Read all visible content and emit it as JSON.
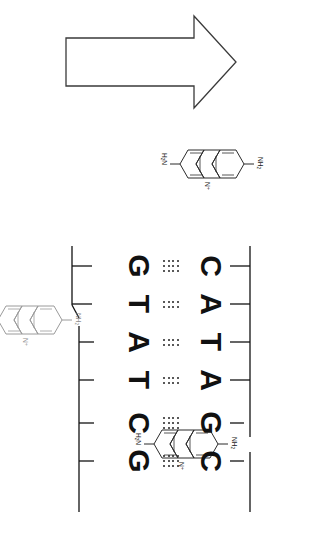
{
  "figure": {
    "kind": "molecular-diagram",
    "orientation": "rotated-90-clockwise",
    "background_color": "#ffffff",
    "ink_color": "#111111",
    "faint_ink_color": "#8d8d8d"
  },
  "arrow": {
    "name": "direction-arrow",
    "points": "up",
    "stroke_color": "#333333"
  },
  "dna": {
    "top_strand": {
      "label": "top-strand",
      "bases": [
        "C",
        "A",
        "T",
        "A",
        "G",
        "C"
      ]
    },
    "bottom_strand": {
      "label": "bottom-strand",
      "bases": [
        "G",
        "T",
        "A",
        "T",
        "C",
        "G"
      ]
    },
    "base_pairs": [
      {
        "top": "C",
        "bottom": "G",
        "hydrogen_bonds": 3
      },
      {
        "top": "A",
        "bottom": "T",
        "hydrogen_bonds": 2
      },
      {
        "top": "T",
        "bottom": "A",
        "hydrogen_bonds": 2
      },
      {
        "top": "A",
        "bottom": "T",
        "hydrogen_bonds": 2
      },
      {
        "top": "G",
        "bottom": "C",
        "hydrogen_bonds": 3
      },
      {
        "top": "C",
        "bottom": "G",
        "hydrogen_bonds": 3
      }
    ],
    "backbone": {
      "top_label": "sugar-phosphate-backbone-top",
      "bottom_label": "sugar-phosphate-backbone-bottom"
    }
  },
  "ligands": [
    {
      "id": "ligand-left",
      "name": "proflavine-free",
      "state": "free in solution",
      "shade": "dark",
      "labels": {
        "amine_top": "NH2",
        "amine_bottom": "H2N",
        "ring_nitrogen": "N+"
      }
    },
    {
      "id": "ligand-intercalated-top",
      "name": "proflavine-intercalated-upper",
      "state": "intercalated",
      "shade": "dark",
      "labels": {
        "amine_top": "NH2",
        "amine_bottom": "H2N",
        "ring_nitrogen": "N+"
      }
    },
    {
      "id": "ligand-intercalated-bottom",
      "name": "proflavine-intercalated-lower",
      "state": "intercalated",
      "shade": "faint",
      "labels": {
        "amine_top": "NH2",
        "amine_bottom": "H2N",
        "ring_nitrogen": "N+"
      }
    }
  ],
  "chem_labels": {
    "nh2": "NH",
    "nh2_sub": "2",
    "h2n_h": "H",
    "h2n_sub": "2",
    "h2n_n": "N",
    "n_plus": "N",
    "n_plus_sup": "+"
  }
}
